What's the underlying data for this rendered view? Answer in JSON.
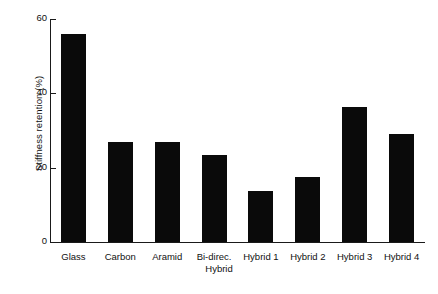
{
  "chart_data": {
    "type": "bar",
    "title": "",
    "subtitle": "",
    "xlabel": "Hybrid",
    "ylabel": "Stiffness retention (%)",
    "categories": [
      "Glass",
      "Carbon",
      "Aramid",
      "Bi-direc.",
      "Hybrid 1",
      "Hybrid 2",
      "Hybrid 3",
      "Hybrid 4"
    ],
    "values": [
      56,
      26.8,
      27,
      23.5,
      13.8,
      17.5,
      36.3,
      29
    ],
    "ylim": [
      0,
      60
    ],
    "yticks": [
      0,
      20,
      40,
      60
    ],
    "ytick_labels": [
      "0",
      "20",
      "40",
      "60"
    ],
    "grid": false,
    "legend": false,
    "legend_position": "none",
    "bar_color": "#0a0a0a",
    "axis_color": "#1a1a1a",
    "background_color": "#ffffff"
  }
}
